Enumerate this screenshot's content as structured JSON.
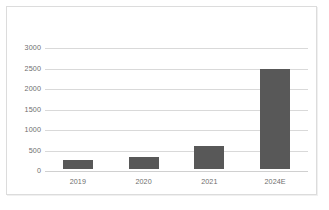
{
  "chart_data": {
    "type": "bar",
    "title": "",
    "subtitle": "",
    "xlabel": "",
    "ylabel": "",
    "categories": [
      "2019",
      "2020",
      "2021",
      "2024E"
    ],
    "values": [
      220,
      290,
      560,
      2450
    ],
    "series": [
      {
        "name": "",
        "values": [
          220,
          290,
          560,
          2450
        ]
      }
    ],
    "ylim": [
      0,
      3000
    ],
    "yticks": [
      0,
      500,
      1000,
      1500,
      2000,
      2500,
      3000
    ],
    "ytick_labels": [
      "0",
      "500",
      "1000",
      "1500",
      "2000",
      "2500",
      "3000"
    ],
    "grid": true,
    "grid_axis": "y",
    "legend": false,
    "legend_position": "none",
    "annotations": [],
    "colors": {
      "bar": "#585858",
      "gridline": "#d9d9d9",
      "axis_text": "#6e6e6e",
      "frame": "#dcdcdc",
      "background": "#ffffff"
    }
  }
}
